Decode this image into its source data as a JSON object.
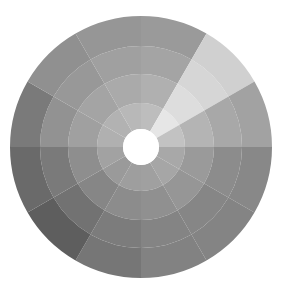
{
  "diagram": {
    "type": "sunburst",
    "center": {
      "x": 141,
      "y": 147
    },
    "hole_radius": 18,
    "ring_radii": [
      18,
      44,
      73,
      101,
      131
    ],
    "sector_count": 12,
    "sector_angle_deg": 30,
    "hole_color": "#ffffff",
    "sectors": [
      {
        "start": 0,
        "end": 30,
        "colors": [
          "#bdbdbd",
          "#b0b0b0",
          "#a4a4a4",
          "#9a9a9a"
        ]
      },
      {
        "start": 30,
        "end": 60,
        "colors": [
          "#e6e6e6",
          "#dddddd",
          "#d6d6d6",
          "#d0d0d0"
        ]
      },
      {
        "start": 60,
        "end": 90,
        "colors": [
          "#c2c2c2",
          "#b4b4b4",
          "#a8a8a8",
          "#a2a2a2"
        ]
      },
      {
        "start": 90,
        "end": 120,
        "colors": [
          "#a8a8a8",
          "#9a9a9a",
          "#8c8c8c",
          "#888888"
        ]
      },
      {
        "start": 120,
        "end": 150,
        "colors": [
          "#a6a6a6",
          "#969696",
          "#868686",
          "#848484"
        ]
      },
      {
        "start": 150,
        "end": 180,
        "colors": [
          "#a0a0a0",
          "#909090",
          "#848484",
          "#828282"
        ]
      },
      {
        "start": 180,
        "end": 210,
        "colors": [
          "#9e9e9e",
          "#8c8c8c",
          "#7c7c7c",
          "#767676"
        ]
      },
      {
        "start": 210,
        "end": 240,
        "colors": [
          "#9a9a9a",
          "#868686",
          "#727272",
          "#5e5e5e"
        ]
      },
      {
        "start": 240,
        "end": 270,
        "colors": [
          "#a2a2a2",
          "#8e8e8e",
          "#7a7a7a",
          "#6a6a6a"
        ]
      },
      {
        "start": 270,
        "end": 300,
        "colors": [
          "#b0b0b0",
          "#a0a0a0",
          "#929292",
          "#7a7a7a"
        ]
      },
      {
        "start": 300,
        "end": 330,
        "colors": [
          "#b2b2b2",
          "#a4a4a4",
          "#989898",
          "#909090"
        ]
      },
      {
        "start": 330,
        "end": 360,
        "colors": [
          "#b8b8b8",
          "#aaaaaa",
          "#a0a0a0",
          "#969696"
        ]
      }
    ]
  }
}
